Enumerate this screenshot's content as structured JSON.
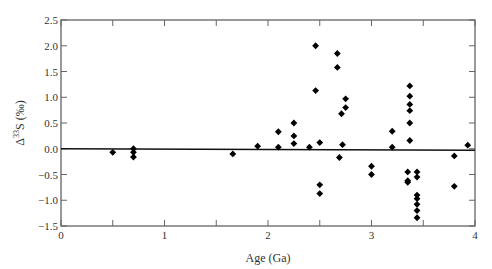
{
  "chart_data": {
    "type": "scatter",
    "title": "",
    "xlabel": "Age (Ga)",
    "ylabel": "Δ33S (‰)",
    "xlim": [
      0,
      4
    ],
    "ylim": [
      -1.5,
      2.5
    ],
    "xticks": [
      "0",
      "1",
      "2",
      "3",
      "4"
    ],
    "yticks": [
      "2.5",
      "2.0",
      "1.5",
      "1.0",
      "0.5",
      "0.0",
      "−0.5",
      "−1.0",
      "−1.5"
    ],
    "grid": false,
    "reference_line": {
      "y": 0.0
    },
    "marker": "diamond",
    "marker_color": "#000000",
    "series": [
      {
        "name": "Δ33S",
        "points": [
          [
            0.5,
            -0.07
          ],
          [
            0.7,
            0.0
          ],
          [
            0.7,
            -0.07
          ],
          [
            0.7,
            -0.16
          ],
          [
            1.66,
            -0.1
          ],
          [
            1.9,
            0.05
          ],
          [
            2.1,
            0.33
          ],
          [
            2.1,
            0.03
          ],
          [
            2.25,
            0.5
          ],
          [
            2.25,
            0.25
          ],
          [
            2.25,
            0.1
          ],
          [
            2.4,
            0.03
          ],
          [
            2.46,
            2.0
          ],
          [
            2.46,
            1.13
          ],
          [
            2.5,
            0.12
          ],
          [
            2.5,
            -0.7
          ],
          [
            2.5,
            -0.87
          ],
          [
            2.67,
            1.85
          ],
          [
            2.67,
            1.58
          ],
          [
            2.69,
            -0.17
          ],
          [
            2.71,
            0.68
          ],
          [
            2.72,
            0.08
          ],
          [
            2.75,
            0.97
          ],
          [
            2.75,
            0.8
          ],
          [
            3.0,
            -0.34
          ],
          [
            3.0,
            -0.5
          ],
          [
            3.2,
            0.34
          ],
          [
            3.2,
            0.03
          ],
          [
            3.37,
            1.22
          ],
          [
            3.37,
            1.02
          ],
          [
            3.37,
            0.86
          ],
          [
            3.37,
            0.74
          ],
          [
            3.37,
            0.5
          ],
          [
            3.37,
            0.16
          ],
          [
            3.35,
            -0.45
          ],
          [
            3.35,
            -0.62
          ],
          [
            3.35,
            -0.65
          ],
          [
            3.44,
            -0.45
          ],
          [
            3.44,
            -0.55
          ],
          [
            3.44,
            -0.9
          ],
          [
            3.44,
            -0.97
          ],
          [
            3.44,
            -1.08
          ],
          [
            3.44,
            -1.2
          ],
          [
            3.44,
            -1.34
          ],
          [
            3.8,
            -0.14
          ],
          [
            3.8,
            -0.73
          ],
          [
            3.93,
            0.07
          ]
        ]
      }
    ]
  }
}
